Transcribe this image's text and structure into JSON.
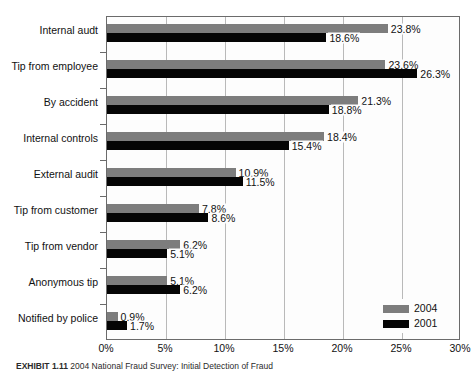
{
  "chart_data": {
    "type": "bar",
    "orientation": "horizontal",
    "title": "",
    "xlabel": "",
    "ylabel": "",
    "xlim": [
      0,
      30
    ],
    "xticks": [
      "0%",
      "5%",
      "10%",
      "15%",
      "20%",
      "25%",
      "30%"
    ],
    "xtick_values": [
      0,
      5,
      10,
      15,
      20,
      25,
      30
    ],
    "grid": true,
    "grid_axis": "x",
    "legend_position": "bottom-right",
    "categories": [
      "Internal audt",
      "Tip from employee",
      "By accident",
      "Internal controls",
      "External audit",
      "Tip from customer",
      "Tip from vendor",
      "Anonymous tip",
      "Notified by police"
    ],
    "series": [
      {
        "name": "2004",
        "color": "#7d7d7d",
        "values": [
          23.8,
          23.6,
          21.3,
          18.4,
          10.9,
          7.8,
          6.2,
          5.1,
          0.9
        ],
        "labels": [
          "23.8%",
          "23.6%",
          "21.3%",
          "18.4%",
          "10.9%",
          "7.8%",
          "6.2%",
          "5.1%",
          "0.9%"
        ]
      },
      {
        "name": "2001",
        "color": "#050505",
        "values": [
          18.6,
          26.3,
          18.8,
          15.4,
          11.5,
          8.6,
          5.1,
          6.2,
          1.7
        ],
        "labels": [
          "18.6%",
          "26.3%",
          "18.8%",
          "15.4%",
          "11.5%",
          "8.6%",
          "5.1%",
          "6.2%",
          "1.7%"
        ]
      }
    ]
  },
  "legend": {
    "items": [
      {
        "label": "2004",
        "color": "#7d7d7d"
      },
      {
        "label": "2001",
        "color": "#050505"
      }
    ]
  },
  "caption": {
    "exhibit_label": "EXHIBIT 1.11",
    "text": "2004 National Fraud Survey: Initial Detection of Fraud"
  }
}
